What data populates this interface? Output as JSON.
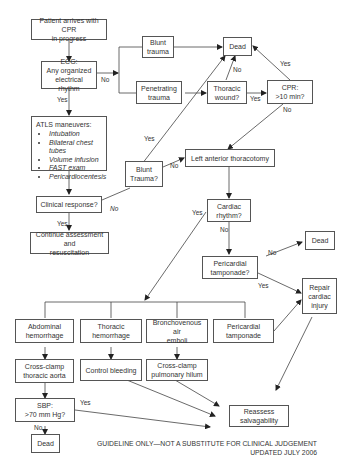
{
  "nodes": {
    "start": "Patient arrives with CPR\nin progress",
    "ecg": "ECG:\nAny organized\nelectrical rhythm",
    "blunt_trauma": "Blunt\ntrauma",
    "penetrating_trauma": "Penetrating\ntrauma",
    "dead_top": "Dead",
    "thoracic_wound": "Thoracic\nwound?",
    "cpr_time": "CPR:\n>10 min?",
    "atls_title": "ATLS maneuvers:",
    "atls_items": [
      "Intubation",
      "Bilateral chest tubes",
      "Volume infusion",
      "FAST exam",
      "Pericardiocentesis"
    ],
    "blunt_trauma_q": "Blunt\nTrauma?",
    "left_thoracotomy": "Left anterior thoracotomy",
    "clinical_response": "Clinical response?",
    "continue": "Continue assessment and\nresuscitation",
    "cardiac_rhythm": "Cardiac\nrhythm?",
    "dead_right": "Dead",
    "pericardial_tamponade_q": "Pericardial\ntamponade?",
    "repair": "Repair\ncardiac\ninjury",
    "abdominal": "Abdominal\nhemorrhage",
    "thoracic_hem": "Thoracic\nhemorrhage",
    "broncho": "Bronchovenous air\nemboli",
    "pericardial_tamp": "Pericardial\ntamponade",
    "crossclamp_aorta": "Cross-clamp\nthoracic aorta",
    "control_bleeding": "Control bleeding",
    "crossclamp_hilum": "Cross-clamp\npulmonary hilum",
    "sbp": "SBP:\n>70 mm Hg?",
    "dead_bottom": "Dead",
    "reassess": "Reassess\nsalvagability"
  },
  "edge_labels": {
    "ecg_no": "No",
    "ecg_yes": "Yes",
    "thoracic_no": "No",
    "thoracic_yes": "Yes",
    "cpr_yes": "Yes",
    "cpr_no": "No",
    "blunt_yes": "Yes",
    "blunt_no": "No",
    "clinical_no": "No",
    "clinical_yes": "Yes",
    "cardiac_yes": "Yes",
    "cardiac_no": "No",
    "tamponade_no": "No",
    "tamponade_yes": "Yes",
    "sbp_yes": "Yes",
    "sbp_no": "No"
  },
  "footer": {
    "line1": "GUIDELINE ONLY—NOT A SUBSTITUTE FOR CLINICAL JUDGEMENT",
    "line2": "UPDATED JULY 2006"
  }
}
